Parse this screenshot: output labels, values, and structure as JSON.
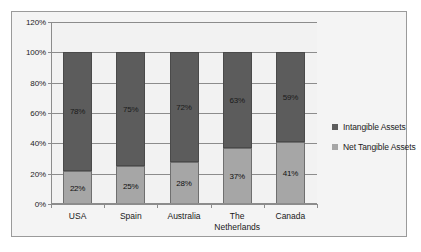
{
  "chart_data": {
    "type": "bar",
    "subtype": "stacked-percentage",
    "title": "",
    "xlabel": "",
    "ylabel": "",
    "ylim": [
      0,
      120
    ],
    "ytick_labels": [
      "0%",
      "20%",
      "40%",
      "60%",
      "80%",
      "100%",
      "120%"
    ],
    "ytick_values": [
      0,
      20,
      40,
      60,
      80,
      100,
      120
    ],
    "grid": true,
    "legend_position": "right",
    "categories": [
      "USA",
      "Spain",
      "Australia",
      "The\nNetherlands",
      "Canada"
    ],
    "series": [
      {
        "name": "Net Tangible Assets",
        "color": "#a6a6a6",
        "values": [
          22,
          25,
          28,
          37,
          41
        ],
        "labels": [
          "22%",
          "25%",
          "28%",
          "37%",
          "41%"
        ]
      },
      {
        "name": "Intangible Assets",
        "color": "#5c5c5c",
        "values": [
          78,
          75,
          72,
          63,
          59
        ],
        "labels": [
          "78%",
          "75%",
          "72%",
          "63%",
          "59%"
        ]
      }
    ]
  },
  "legend": {
    "items": [
      {
        "label": "Intangible Assets",
        "color": "#5c5c5c"
      },
      {
        "label": "Net Tangible Assets",
        "color": "#a6a6a6"
      }
    ]
  },
  "colors": {
    "intangible": "#5c5c5c",
    "net_tangible": "#a6a6a6",
    "plot_background": "#f2f2f2",
    "frame_background": "#f4f4f4",
    "gridline": "#8c8c8c"
  }
}
